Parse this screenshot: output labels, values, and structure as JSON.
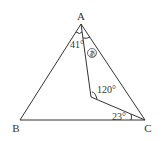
{
  "diagram": {
    "type": "geometry-triangle",
    "vertices": {
      "A": {
        "label": "A",
        "x": 81,
        "y": 24
      },
      "B": {
        "label": "B",
        "x": 20,
        "y": 120
      },
      "C": {
        "label": "C",
        "x": 145,
        "y": 120
      },
      "P": {
        "label": "",
        "x": 91,
        "y": 97
      }
    },
    "angles": {
      "angle_BAP": "41°",
      "angle_PAC": "あ",
      "angle_APC": "120°",
      "angle_PCB": "23°"
    },
    "colors": {
      "line": "#333333",
      "background": "#ffffff"
    }
  }
}
